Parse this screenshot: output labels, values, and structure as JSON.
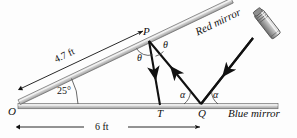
{
  "figure": {
    "background_color": "#fdfdfd",
    "ink_color": "#111111",
    "mirror_fill": "#d4d4d4",
    "mirror_edge": "#6e6e6e"
  },
  "points": {
    "O": "O",
    "P": "P",
    "T": "T",
    "Q": "Q"
  },
  "angles": {
    "incline": "25°",
    "theta_upper": "θ",
    "theta_lower": "θ",
    "alpha_left": "α",
    "alpha_right": "α"
  },
  "labels": {
    "red_mirror": "Red mirror",
    "blue_mirror": "Blue mirror"
  },
  "dimensions": {
    "slant_length": "4.7 ft",
    "base_length": "6 ft"
  },
  "icons": {
    "laser_pointer": "laser-pointer-icon"
  }
}
